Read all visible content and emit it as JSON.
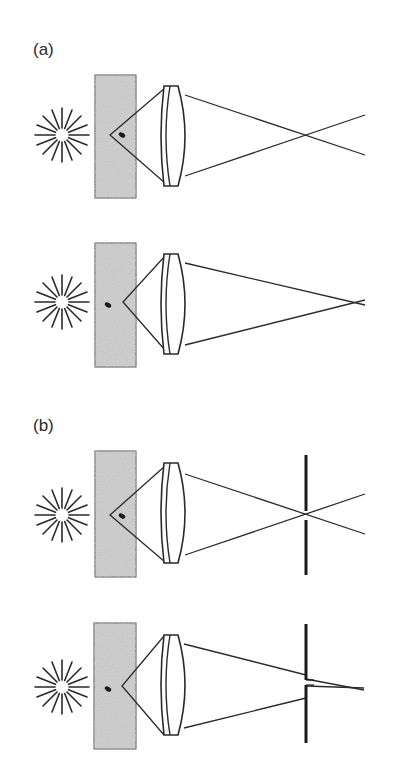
{
  "figure": {
    "panels": [
      {
        "label": "(a)",
        "description": "Without pinhole: in-focus and out-of-focus fluorescence imaging through lens",
        "diagrams": [
          {
            "id": "a-top",
            "focus_state": "focal point behind emitter; rays cross before end"
          },
          {
            "id": "a-bottom",
            "focus_state": "emitter in focus; rays converge at right"
          }
        ]
      },
      {
        "label": "(b)",
        "description": "With pinhole aperture: out-of-focus light blocked, in-focus light passes",
        "diagrams": [
          {
            "id": "b-top",
            "focus_state": "rays cross at pinhole plane"
          },
          {
            "id": "b-bottom",
            "focus_state": "rays pass through pinhole gap"
          }
        ]
      }
    ],
    "elements": {
      "light_source": "starburst-icon",
      "sample": "speckled-sample-block",
      "emitter": "fluorescent-dot",
      "optic": "convex-lens",
      "aperture": "pinhole-slit"
    },
    "colors": {
      "line": "#2a2a2a",
      "sample_fill": "#c8c8c8",
      "background": "#ffffff"
    }
  }
}
